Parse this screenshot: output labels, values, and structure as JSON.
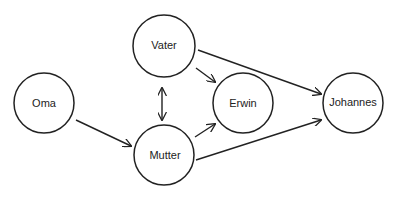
{
  "diagram": {
    "type": "directed-graph",
    "nodes": [
      {
        "id": "oma",
        "label": "Oma",
        "cx": 44,
        "cy": 103,
        "r": 30
      },
      {
        "id": "vater",
        "label": "Vater",
        "cx": 164,
        "cy": 46,
        "r": 31
      },
      {
        "id": "mutter",
        "label": "Mutter",
        "cx": 164,
        "cy": 155,
        "r": 30
      },
      {
        "id": "erwin",
        "label": "Erwin",
        "cx": 243,
        "cy": 103,
        "r": 30
      },
      {
        "id": "johannes",
        "label": "Johannes",
        "cx": 353,
        "cy": 103,
        "r": 30
      }
    ],
    "edges": [
      {
        "from": "oma",
        "to": "mutter",
        "bidirectional": false
      },
      {
        "from": "vater",
        "to": "mutter",
        "bidirectional": true
      },
      {
        "from": "vater",
        "to": "erwin",
        "bidirectional": false
      },
      {
        "from": "vater",
        "to": "johannes",
        "bidirectional": false
      },
      {
        "from": "mutter",
        "to": "erwin",
        "bidirectional": false
      },
      {
        "from": "mutter",
        "to": "johannes",
        "bidirectional": false
      }
    ]
  }
}
